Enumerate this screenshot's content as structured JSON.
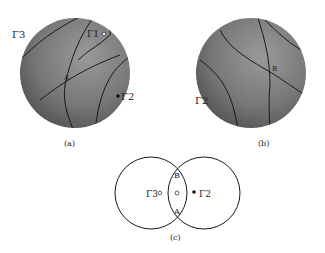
{
  "panels": {
    "a": {
      "caption": "(a)",
      "labels": {
        "gamma3": "Γ3",
        "gamma1": "Γ1",
        "gamma2": "Γ2",
        "point": "A"
      }
    },
    "b": {
      "caption": "(b)",
      "labels": {
        "gamma2": "Γ2",
        "point": "B"
      }
    },
    "c": {
      "caption": "(c)",
      "labels": {
        "gamma3": "Γ3",
        "gamma2": "Γ2",
        "top": "B",
        "bottom": "A"
      }
    }
  },
  "colors": {
    "sphere_light": "#8a8a8a",
    "sphere_dark": "#555555",
    "line": "#1a1a1a"
  }
}
